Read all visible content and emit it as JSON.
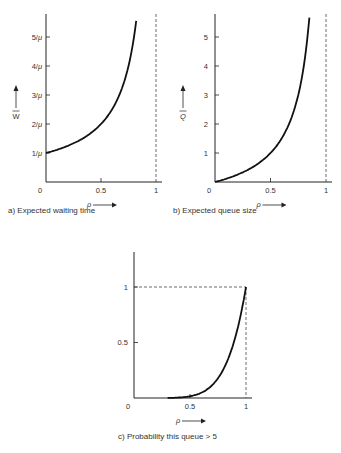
{
  "chart_data": [
    {
      "type": "line",
      "title": "a) Expected waiting time",
      "xlabel": "ρ",
      "ylabel": "W̄",
      "xticks": [
        "0",
        "0.5",
        "1"
      ],
      "yticks": [
        "1/μ",
        "2/μ",
        "3/μ",
        "4/μ",
        "5/μ"
      ],
      "xlim": [
        0,
        1
      ],
      "ylim": [
        0,
        5.8
      ],
      "asymptote_x": 1,
      "x": [
        0,
        0.1,
        0.2,
        0.3,
        0.4,
        0.5,
        0.6,
        0.7,
        0.75,
        0.8,
        0.83
      ],
      "y": [
        1,
        1.11,
        1.25,
        1.43,
        1.67,
        2,
        2.5,
        3.33,
        4,
        5,
        5.88
      ]
    },
    {
      "type": "line",
      "title": "b) Expected queue size",
      "xlabel": "ρ",
      "ylabel": "Q̄",
      "xticks": [
        "0",
        "0.5",
        "1"
      ],
      "yticks": [
        "1",
        "2",
        "3",
        "4",
        "5"
      ],
      "xlim": [
        0,
        1
      ],
      "ylim": [
        0,
        5.8
      ],
      "asymptote_x": 1,
      "x": [
        0,
        0.1,
        0.2,
        0.3,
        0.4,
        0.5,
        0.6,
        0.7,
        0.75,
        0.8,
        0.85
      ],
      "y": [
        0,
        0.11,
        0.25,
        0.43,
        0.67,
        1,
        1.5,
        2.33,
        3,
        4,
        5.67
      ]
    },
    {
      "type": "line",
      "title": "c) Probability this queue > 5",
      "xlabel": "ρ",
      "ylabel": "",
      "xticks": [
        "0",
        "0.5",
        "1"
      ],
      "yticks": [
        "0.5",
        "1"
      ],
      "xlim": [
        0,
        1
      ],
      "ylim": [
        0,
        1.45
      ],
      "reference_lines": {
        "y": 1,
        "x": 1
      },
      "x": [
        0.3,
        0.4,
        0.5,
        0.6,
        0.7,
        0.8,
        0.9,
        1.0
      ],
      "y": [
        0.0007,
        0.004,
        0.016,
        0.047,
        0.118,
        0.262,
        0.531,
        1.0
      ]
    }
  ],
  "captions": {
    "a": "a) Expected waiting time",
    "b": "b) Expected queue size",
    "c": "c) Probability this queue > 5"
  },
  "labels": {
    "rho": "ρ",
    "w": "W",
    "q": "Q"
  }
}
